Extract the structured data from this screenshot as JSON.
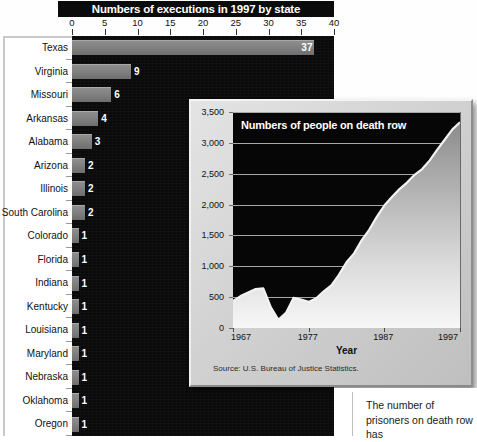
{
  "bar_chart": {
    "title": "Numbers of executions in 1997 by state",
    "axis_ticks": [
      "0",
      "5",
      "10",
      "15",
      "20",
      "25",
      "30",
      "35",
      "40"
    ],
    "axis_max": 40,
    "rows": [
      {
        "state": "Texas",
        "value": 37,
        "label": "37"
      },
      {
        "state": "Virginia",
        "value": 9,
        "label": "9"
      },
      {
        "state": "Missouri",
        "value": 6,
        "label": "6"
      },
      {
        "state": "Arkansas",
        "value": 4,
        "label": "4"
      },
      {
        "state": "Alabama",
        "value": 3,
        "label": "3"
      },
      {
        "state": "Arizona",
        "value": 2,
        "label": "2"
      },
      {
        "state": "Illinois",
        "value": 2,
        "label": "2"
      },
      {
        "state": "South Carolina",
        "value": 2,
        "label": "2"
      },
      {
        "state": "Colorado",
        "value": 1,
        "label": "1"
      },
      {
        "state": "Florida",
        "value": 1,
        "label": "1"
      },
      {
        "state": "Indiana",
        "value": 1,
        "label": "1"
      },
      {
        "state": "Kentucky",
        "value": 1,
        "label": "1"
      },
      {
        "state": "Louisiana",
        "value": 1,
        "label": "1"
      },
      {
        "state": "Maryland",
        "value": 1,
        "label": "1"
      },
      {
        "state": "Nebraska",
        "value": 1,
        "label": "1"
      },
      {
        "state": "Oklahoma",
        "value": 1,
        "label": "1"
      },
      {
        "state": "Oregon",
        "value": 1,
        "label": "1"
      }
    ]
  },
  "inset_chart": {
    "title": "Numbers of people on death row",
    "xlabel": "Year",
    "source": "Source: U.S. Bureau of Justice Statistics.",
    "y_ticks": [
      "0",
      "500",
      "1,000",
      "1,500",
      "2,000",
      "2,500",
      "3,000",
      "3,500"
    ],
    "x_ticks": [
      "1967",
      "1977",
      "1987",
      "1997"
    ]
  },
  "body_text": "The number of prisoners on death row has",
  "colors": {
    "panel_black": "#0a0a0a",
    "bar_gray": "#828282",
    "card_gray": "#d2d2d2",
    "gridline": "#b9b9b9",
    "text_dark": "#111111",
    "text_light": "#ffffff"
  },
  "chart_data": [
    {
      "type": "bar",
      "title": "Numbers of executions in 1997 by state",
      "orientation": "horizontal",
      "xlabel": "",
      "ylabel": "",
      "xlim": [
        0,
        40
      ],
      "grid": false,
      "tick_labels": [
        "0",
        "5",
        "10",
        "15",
        "20",
        "25",
        "30",
        "35",
        "40"
      ],
      "categories": [
        "Texas",
        "Virginia",
        "Missouri",
        "Arkansas",
        "Alabama",
        "Arizona",
        "Illinois",
        "South Carolina",
        "Colorado",
        "Florida",
        "Indiana",
        "Kentucky",
        "Louisiana",
        "Maryland",
        "Nebraska",
        "Oklahoma",
        "Oregon"
      ],
      "values": [
        37,
        9,
        6,
        4,
        3,
        2,
        2,
        2,
        1,
        1,
        1,
        1,
        1,
        1,
        1,
        1,
        1
      ],
      "data_labels": [
        "37",
        "9",
        "6",
        "4",
        "3",
        "2",
        "2",
        "2",
        "1",
        "1",
        "1",
        "1",
        "1",
        "1",
        "1",
        "1",
        "1"
      ]
    },
    {
      "type": "area",
      "title": "Numbers of people on death row",
      "xlabel": "Year",
      "ylabel": "",
      "source": "Source: U.S. Bureau of Justice Statistics.",
      "xlim": [
        1967,
        1997
      ],
      "ylim": [
        0,
        3500
      ],
      "grid": true,
      "y_ticks": [
        0,
        500,
        1000,
        1500,
        2000,
        2500,
        3000,
        3500
      ],
      "y_tick_labels": [
        "0",
        "500",
        "1,000",
        "1,500",
        "2,000",
        "2,500",
        "3,000",
        "3,500"
      ],
      "x_ticks": [
        1967,
        1977,
        1987,
        1997
      ],
      "x_tick_labels": [
        "1967",
        "1977",
        "1987",
        "1997"
      ],
      "x": [
        1967,
        1968,
        1969,
        1970,
        1971,
        1972,
        1973,
        1974,
        1975,
        1976,
        1977,
        1978,
        1979,
        1980,
        1981,
        1982,
        1983,
        1984,
        1985,
        1986,
        1987,
        1988,
        1989,
        1990,
        1991,
        1992,
        1993,
        1994,
        1995,
        1996,
        1997
      ],
      "y": [
        435,
        517,
        575,
        631,
        642,
        334,
        134,
        244,
        488,
        460,
        423,
        482,
        593,
        692,
        860,
        1066,
        1209,
        1420,
        1591,
        1800,
        1984,
        2124,
        2250,
        2356,
        2482,
        2575,
        2716,
        2890,
        3054,
        3219,
        3335
      ]
    }
  ]
}
